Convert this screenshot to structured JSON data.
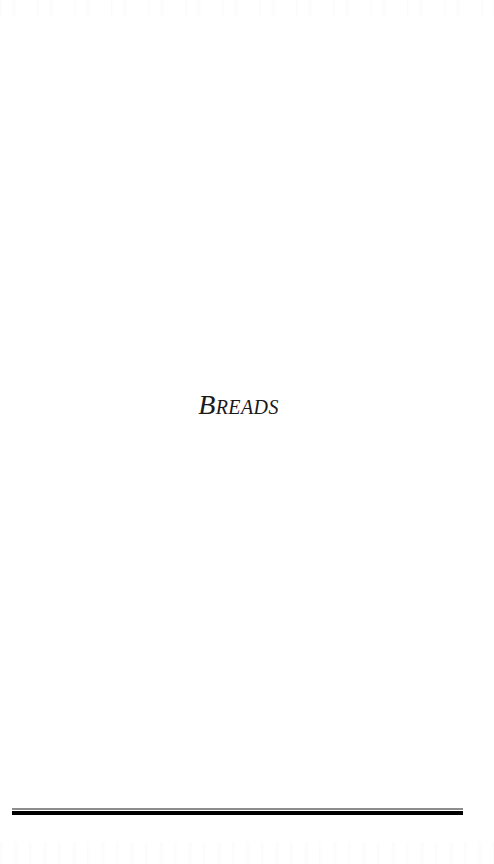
{
  "page": {
    "background_color": "#ffffff",
    "width": 494,
    "height": 864
  },
  "section_divider": {
    "title": "Breads",
    "title_color": "#1a1a1a",
    "title_style": "italic small-caps serif"
  },
  "foot_rule": {
    "thin_line_color": "#8d8d8d",
    "thick_line_color": "#000000"
  }
}
